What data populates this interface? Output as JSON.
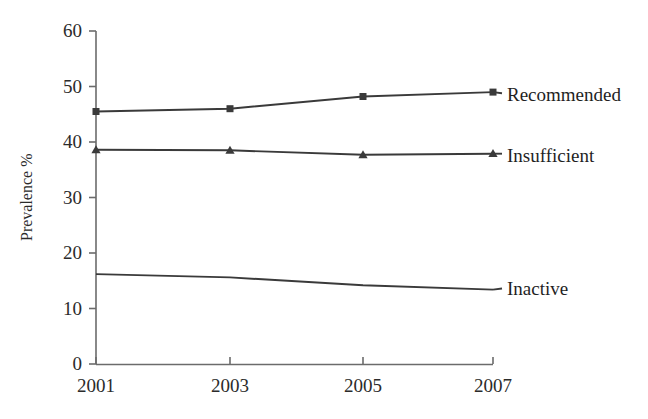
{
  "chart_data": {
    "type": "line",
    "title": "",
    "xlabel": "",
    "ylabel": "Prevalence %",
    "x": [
      2001,
      2003,
      2005,
      2007
    ],
    "xtick_labels": [
      "2001",
      "2003",
      "2005",
      "2007"
    ],
    "ytick_labels": [
      "0",
      "10",
      "20",
      "30",
      "40",
      "50",
      "60"
    ],
    "yticks": [
      0,
      10,
      20,
      30,
      40,
      50,
      60
    ],
    "ylim": [
      0,
      60
    ],
    "xlim": [
      2001,
      2007
    ],
    "grid": false,
    "legend_position": "right-inline",
    "series": [
      {
        "name": "Recommended",
        "values": [
          45.5,
          46.0,
          48.2,
          49.0
        ],
        "marker": "square",
        "color": "#3a3a3a",
        "label_y_value": 48.8
      },
      {
        "name": "Insufficient",
        "values": [
          38.6,
          38.5,
          37.7,
          37.9
        ],
        "marker": "triangle",
        "color": "#3a3a3a",
        "label_y_value": 37.9
      },
      {
        "name": "Inactive",
        "values": [
          16.2,
          15.6,
          14.2,
          13.4
        ],
        "marker": "none",
        "color": "#3a3a3a",
        "label_y_value": 13.6
      }
    ]
  },
  "axis": {
    "line_color": "#6b6b6b",
    "tick_color": "#6b6b6b"
  },
  "labels": {
    "y_axis_title": "Prevalence %",
    "ytick_0": "0",
    "ytick_10": "10",
    "ytick_20": "20",
    "ytick_30": "30",
    "ytick_40": "40",
    "ytick_50": "50",
    "ytick_60": "60",
    "xtick_2001": "2001",
    "xtick_2003": "2003",
    "xtick_2005": "2005",
    "xtick_2007": "2007",
    "series_recommended": "Recommended",
    "series_insufficient": "Insufficient",
    "series_inactive": "Inactive"
  }
}
